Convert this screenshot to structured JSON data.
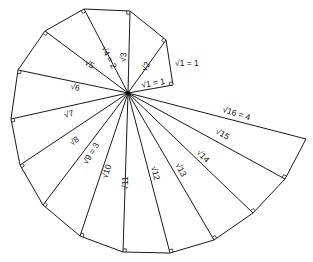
{
  "diagram": {
    "title": "",
    "type": "spiral_of_theodorus",
    "colors": {
      "line": "#1a1a1a",
      "background": "#ffffff"
    },
    "center": [
      128,
      93
    ],
    "vertices": [
      [
        173,
        85
      ],
      [
        166,
        40
      ],
      [
        130,
        11
      ],
      [
        84,
        9
      ],
      [
        45,
        31
      ],
      [
        18,
        70
      ],
      [
        11,
        119
      ],
      [
        20,
        165
      ],
      [
        43,
        205
      ],
      [
        80,
        236
      ],
      [
        123,
        252
      ],
      [
        170,
        253
      ],
      [
        214,
        240
      ],
      [
        253,
        213
      ],
      [
        285,
        179
      ],
      [
        306,
        139
      ]
    ],
    "labels": {
      "outer_leg": "√1 = 1",
      "hyp1": "√1 = 1",
      "hyp2": "√2",
      "hyp3": "√3",
      "hyp4": "√4 = 2",
      "hyp5": "√5",
      "hyp6": "√6",
      "hyp7": "√7",
      "hyp8": "√8",
      "hyp9": "√9 = 3",
      "hyp10": "√10",
      "hyp11": "√11",
      "hyp12": "√12",
      "hyp13": "√13",
      "hyp14": "√14",
      "hyp15": "√15",
      "hyp16": "√16 = 4"
    }
  }
}
